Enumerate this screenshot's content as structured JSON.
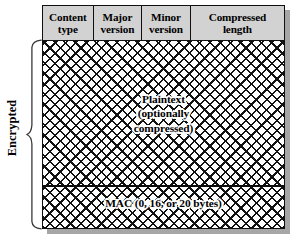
{
  "diagram": {
    "colors": {
      "header_fill": "#d2d2d2",
      "stroke": "#101010",
      "shadow": "#a6a6a6",
      "hatch": "#111111",
      "background": "#ffffff"
    },
    "bracket_label": "Encrypted",
    "header_fields": [
      {
        "name": "content-type",
        "line1": "Content",
        "line2": "type"
      },
      {
        "name": "major-version",
        "line1": "Major",
        "line2": "version"
      },
      {
        "name": "minor-version",
        "line1": "Minor",
        "line2": "version"
      },
      {
        "name": "compressed-length",
        "line1": "Compressed",
        "line2": "length"
      }
    ],
    "body": {
      "plaintext": {
        "line1": "Plaintext",
        "line2": "(optionally",
        "line3": "compressed)"
      },
      "mac": {
        "label": "MAC (0, 16, or 20 bytes)"
      }
    }
  }
}
